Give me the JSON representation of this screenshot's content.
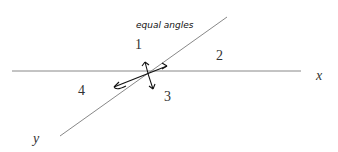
{
  "diagram": {
    "lines": {
      "x": {
        "label": "x",
        "from": [
          12,
          71
        ],
        "to": [
          301,
          71
        ]
      },
      "y": {
        "label": "y",
        "from": [
          60,
          136
        ],
        "to": [
          227,
          17
        ]
      }
    },
    "angles": [
      {
        "label": "1",
        "pos": [
          137,
          48
        ]
      },
      {
        "label": "2",
        "pos": [
          219,
          59
        ]
      },
      {
        "label": "3",
        "pos": [
          166,
          101
        ]
      },
      {
        "label": "4",
        "pos": [
          80,
          95
        ]
      }
    ],
    "annotation": {
      "text": "equal angles",
      "pos": [
        136,
        28
      ]
    },
    "colors": {
      "line": "#888888",
      "ink": "#111111",
      "text": "#333333"
    }
  }
}
